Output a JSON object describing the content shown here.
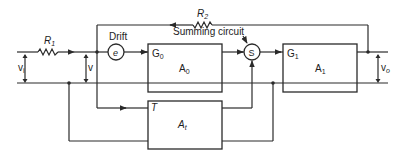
{
  "diagram": {
    "type": "block-diagram",
    "components": {
      "r1": {
        "label": "R",
        "sub": "1"
      },
      "r2": {
        "label": "R",
        "sub": "2"
      },
      "drift": {
        "label": "Drift",
        "symbol": "e"
      },
      "summing": {
        "label": "Summing circuit",
        "symbol": "S"
      },
      "amp0": {
        "gain_label": "G",
        "gain_sub": "0",
        "name": "A",
        "name_sub": "0"
      },
      "amp1": {
        "gain_label": "G",
        "gain_sub": "1",
        "name": "A",
        "name_sub": "1"
      },
      "ampt": {
        "gain_label": "T",
        "name": "A",
        "name_sub": "t"
      }
    },
    "voltages": {
      "vi": {
        "label": "v",
        "sub": "i"
      },
      "v": {
        "label": "v"
      },
      "vo": {
        "label": "v",
        "sub": "o"
      }
    },
    "connections": [
      "vi -> R1 -> node",
      "node -> Drift(e) -> A0 (G0)",
      "node -> At (T)",
      "A0 -> S",
      "At -> S",
      "S -> A1 (G1)",
      "A1 -> vo",
      "vo -> R2 -> node (feedback)"
    ],
    "colors": {
      "line": "#2a2a2a",
      "background": "#ffffff"
    }
  }
}
